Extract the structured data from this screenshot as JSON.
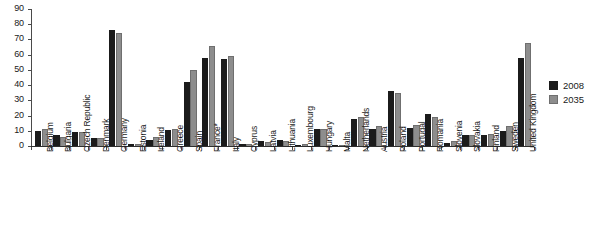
{
  "chart_data": {
    "type": "bar",
    "title": "",
    "subtitle": "",
    "xlabel": "",
    "ylabel": "",
    "ylim": [
      0,
      90
    ],
    "ytick_step": 10,
    "yticks": [
      "0",
      "10",
      "20",
      "30",
      "40",
      "50",
      "60",
      "70",
      "80",
      "90"
    ],
    "grid": false,
    "legend_position": "right",
    "orientation": "vertical",
    "group_mode": "clustered",
    "categories": [
      "Belgium",
      "Bulgaria",
      "Czech Republic",
      "Denmark",
      "Germany",
      "Estonia",
      "Ireland",
      "Greece",
      "Spain",
      "France*",
      "Italy",
      "Cyprus",
      "Latvia",
      "Lithuania",
      "Luxembourg",
      "Hungary",
      "Malta",
      "Netherlands",
      "Austria",
      "Poland",
      "Portugal",
      "Romania",
      "Slovenia",
      "Slovakia",
      "Finland",
      "Sweden",
      "United Kingdom"
    ],
    "series": [
      {
        "name": "2008",
        "color": "#1b1b1b",
        "values": [
          10,
          7,
          9.5,
          5.5,
          76,
          1,
          4,
          10.5,
          42,
          58,
          57,
          1,
          3,
          4,
          0.5,
          11,
          0.3,
          18,
          11,
          36,
          12,
          21,
          2,
          7,
          7,
          10,
          58
        ]
      },
      {
        "name": "2035",
        "color": "#8d8d8d",
        "values": [
          11,
          6,
          9.5,
          5.5,
          74,
          1.5,
          6,
          11.5,
          50,
          66,
          59,
          1.5,
          2.5,
          3.5,
          1,
          11,
          0.4,
          19,
          13,
          35,
          14,
          19,
          3,
          7,
          8,
          13,
          68
        ]
      }
    ]
  },
  "legend": {
    "items": [
      {
        "label": "2008"
      },
      {
        "label": "2035"
      }
    ]
  }
}
